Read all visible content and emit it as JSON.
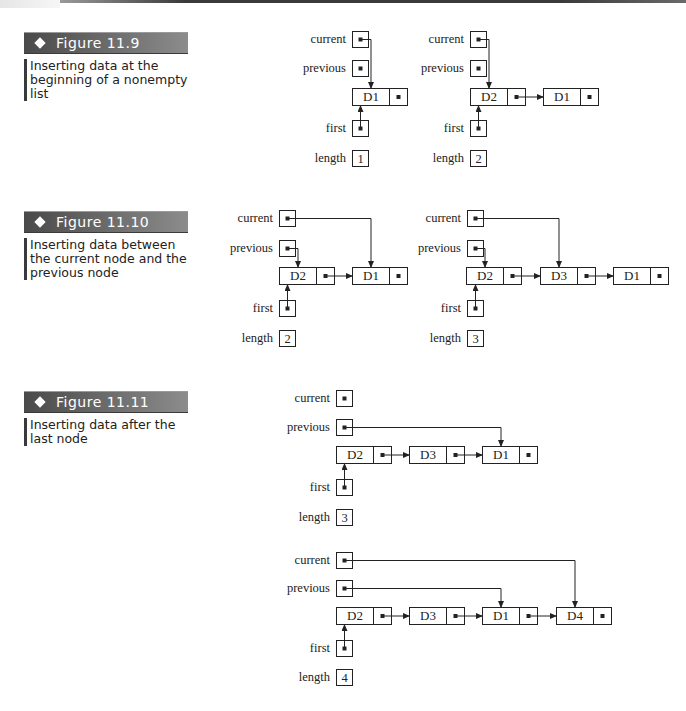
{
  "page": {
    "colors": {
      "label_bar_dark": "#4a4a4a",
      "label_bar_light": "#8c8c8c",
      "line": "#222222"
    }
  },
  "figures": [
    {
      "id": "fig-11-9",
      "label": "Figure 11.9",
      "caption": "Inserting data at the beginning of a nonempty list",
      "label_top": 32,
      "caption_top": 59,
      "diagrams": [
        {
          "vars": {
            "current": {
              "x": 352,
              "y": 31
            },
            "previous": {
              "x": 352,
              "y": 60
            },
            "first": {
              "x": 352,
              "y": 120
            },
            "length": {
              "x": 352,
              "y": 150,
              "value": "1"
            }
          },
          "nodes_y": 88,
          "nodes": [
            {
              "label": "D1",
              "x": 352
            }
          ],
          "pointers": {
            "current": 0,
            "previous": null,
            "first": 0
          }
        },
        {
          "vars": {
            "current": {
              "x": 470,
              "y": 31
            },
            "previous": {
              "x": 470,
              "y": 60
            },
            "first": {
              "x": 470,
              "y": 120
            },
            "length": {
              "x": 470,
              "y": 150,
              "value": "2"
            }
          },
          "nodes_y": 88,
          "nodes": [
            {
              "label": "D2",
              "x": 470
            },
            {
              "label": "D1",
              "x": 543
            }
          ],
          "pointers": {
            "current": 0,
            "previous": null,
            "first": 0
          }
        }
      ]
    },
    {
      "id": "fig-11-10",
      "label": "Figure 11.10",
      "caption": "Inserting data between the current node and the previous node",
      "label_top": 211,
      "caption_top": 238,
      "diagrams": [
        {
          "vars": {
            "current": {
              "x": 279,
              "y": 210
            },
            "previous": {
              "x": 279,
              "y": 240
            },
            "first": {
              "x": 279,
              "y": 300
            },
            "length": {
              "x": 279,
              "y": 330,
              "value": "2"
            }
          },
          "nodes_y": 267,
          "nodes": [
            {
              "label": "D2",
              "x": 279
            },
            {
              "label": "D1",
              "x": 352
            }
          ],
          "pointers": {
            "current": 1,
            "previous": 0,
            "first": 0
          }
        },
        {
          "vars": {
            "current": {
              "x": 467,
              "y": 210
            },
            "previous": {
              "x": 467,
              "y": 240
            },
            "first": {
              "x": 467,
              "y": 300
            },
            "length": {
              "x": 467,
              "y": 330,
              "value": "3"
            }
          },
          "nodes_y": 267,
          "nodes": [
            {
              "label": "D2",
              "x": 466
            },
            {
              "label": "D3",
              "x": 540
            },
            {
              "label": "D1",
              "x": 613
            }
          ],
          "pointers": {
            "current": 1,
            "previous": 0,
            "first": 0
          }
        }
      ]
    },
    {
      "id": "fig-11-11",
      "label": "Figure 11.11",
      "caption": "Inserting data after the last node",
      "label_top": 391,
      "caption_top": 418,
      "diagrams": [
        {
          "vars": {
            "current": {
              "x": 336,
              "y": 390
            },
            "previous": {
              "x": 336,
              "y": 419
            },
            "first": {
              "x": 336,
              "y": 479
            },
            "length": {
              "x": 336,
              "y": 509,
              "value": "3"
            }
          },
          "nodes_y": 446,
          "nodes": [
            {
              "label": "D2",
              "x": 336
            },
            {
              "label": "D3",
              "x": 409
            },
            {
              "label": "D1",
              "x": 482
            }
          ],
          "pointers": {
            "current": null,
            "previous": 2,
            "first": 0
          }
        },
        {
          "vars": {
            "current": {
              "x": 336,
              "y": 552
            },
            "previous": {
              "x": 336,
              "y": 580
            },
            "first": {
              "x": 336,
              "y": 640
            },
            "length": {
              "x": 336,
              "y": 669,
              "value": "4"
            }
          },
          "nodes_y": 607,
          "nodes": [
            {
              "label": "D2",
              "x": 336
            },
            {
              "label": "D3",
              "x": 409
            },
            {
              "label": "D1",
              "x": 482
            },
            {
              "label": "D4",
              "x": 556
            }
          ],
          "pointers": {
            "current": 3,
            "previous": 2,
            "first": 0
          }
        }
      ]
    }
  ],
  "var_labels": {
    "current": "current",
    "previous": "previous",
    "first": "first",
    "length": "length"
  }
}
